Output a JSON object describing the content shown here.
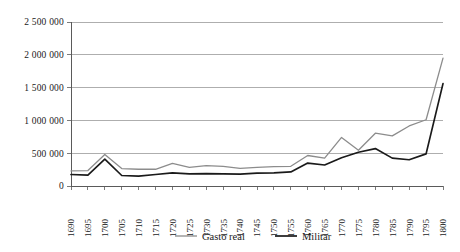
{
  "chart_data": {
    "type": "line",
    "title": "",
    "xlabel": "",
    "ylabel": "",
    "grid": true,
    "legend_position": "bottom",
    "ylim": [
      0,
      2500000
    ],
    "ytick_labels": [
      "0",
      "500 000",
      "1 000 000",
      "1 500 000",
      "2 000 000",
      "2 500 000"
    ],
    "ytick_values": [
      0,
      500000,
      1000000,
      1500000,
      2000000,
      2500000
    ],
    "categories": [
      "1690",
      "1695",
      "1700",
      "1705",
      "1710",
      "1715",
      "1720",
      "1725",
      "1730",
      "1735",
      "1740",
      "1745",
      "1750",
      "1755",
      "1760",
      "1765",
      "1770",
      "1775",
      "1780",
      "1785",
      "1790",
      "1795",
      "1800"
    ],
    "series": [
      {
        "name": "Gasto real",
        "color": "#8c8c8c",
        "width": 1.3,
        "values": [
          230000,
          235000,
          480000,
          265000,
          255000,
          255000,
          345000,
          285000,
          310000,
          300000,
          270000,
          285000,
          295000,
          300000,
          465000,
          425000,
          740000,
          545000,
          805000,
          765000,
          915000,
          1010000,
          1950000
        ]
      },
      {
        "name": "Militar",
        "color": "#1a1a1a",
        "width": 1.7,
        "values": [
          175000,
          165000,
          410000,
          160000,
          150000,
          175000,
          200000,
          185000,
          190000,
          185000,
          180000,
          195000,
          200000,
          215000,
          350000,
          320000,
          430000,
          515000,
          570000,
          425000,
          400000,
          490000,
          1560000
        ]
      }
    ]
  },
  "legend": {
    "items": [
      {
        "label": "Gasto real",
        "color": "#8c8c8c"
      },
      {
        "label": "Militar",
        "color": "#1a1a1a"
      }
    ]
  }
}
